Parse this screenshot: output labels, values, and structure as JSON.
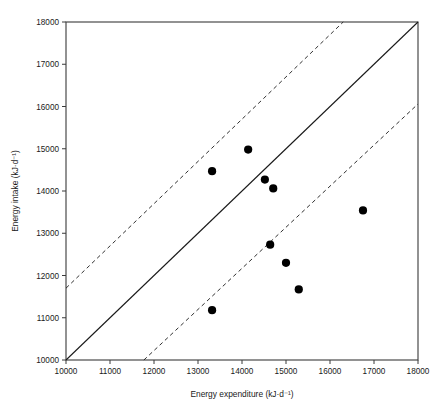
{
  "chart_data": {
    "type": "scatter",
    "title": "",
    "xlabel": "Energy expenditure (kJ·d⁻¹)",
    "ylabel": "Energy intake (kJ·d⁻¹)",
    "xlim": [
      10000,
      18000
    ],
    "ylim": [
      10000,
      18000
    ],
    "grid": false,
    "legend": "none",
    "xticks": [
      10000,
      11000,
      12000,
      13000,
      14000,
      15000,
      16000,
      17000,
      18000
    ],
    "yticks": [
      10000,
      11000,
      12000,
      13000,
      14000,
      15000,
      16000,
      17000,
      18000
    ],
    "xtick_labels": [
      "10000",
      "11000",
      "12000",
      "13000",
      "14000",
      "15000",
      "16000",
      "17000",
      "18000"
    ],
    "ytick_labels": [
      "10000",
      "11000",
      "12000",
      "13000",
      "14000",
      "15000",
      "16000",
      "17000",
      "18000"
    ],
    "series": [
      {
        "name": "Participants",
        "marker": "filled-circle",
        "color": "#000000",
        "points": [
          {
            "x": 13320,
            "y": 14470
          },
          {
            "x": 14140,
            "y": 14980
          },
          {
            "x": 14520,
            "y": 14270
          },
          {
            "x": 14710,
            "y": 14060
          },
          {
            "x": 14640,
            "y": 12730
          },
          {
            "x": 15000,
            "y": 12300
          },
          {
            "x": 15290,
            "y": 11670
          },
          {
            "x": 16750,
            "y": 13540
          },
          {
            "x": 13320,
            "y": 11180
          }
        ]
      }
    ],
    "reference_lines": [
      {
        "name": "line-of-identity",
        "style": "solid",
        "color": "#1a1a1a",
        "x1": 10000,
        "y1": 10000,
        "x2": 18000,
        "y2": 18000
      },
      {
        "name": "upper-limit-of-agreement",
        "style": "dashed",
        "color": "#1a1a1a",
        "x1": 10000,
        "y1": 11700,
        "x2": 16300,
        "y2": 18000
      },
      {
        "name": "lower-limit-of-agreement",
        "style": "dashed",
        "color": "#1a1a1a",
        "x1": 11770,
        "y1": 10000,
        "x2": 18000,
        "y2": 16060
      }
    ]
  }
}
